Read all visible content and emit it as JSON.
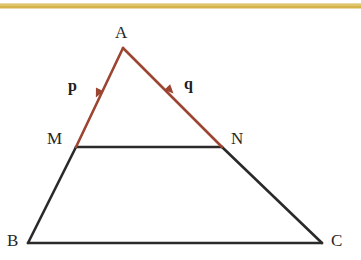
{
  "figure": {
    "type": "geometry-diagram",
    "background_color": "#ffffff",
    "width": 361,
    "height": 260,
    "top_rule": {
      "name": "gold-divider",
      "color": "#d4b44a",
      "y": 6,
      "thickness": 5
    },
    "colors": {
      "vector_stroke": "#9c4530",
      "edge_stroke": "#2a2a2a",
      "label_text": "#262626"
    },
    "points": {
      "A": {
        "label": "A",
        "x": 123,
        "y": 48
      },
      "M": {
        "label": "M",
        "x": 76,
        "y": 147
      },
      "N": {
        "label": "N",
        "x": 222,
        "y": 147
      },
      "B": {
        "label": "B",
        "x": 28,
        "y": 243
      },
      "C": {
        "label": "C",
        "x": 322,
        "y": 243
      }
    },
    "vectors": [
      {
        "label": "p",
        "from": "A",
        "to": "M",
        "color": "#9c4530",
        "arrow_at": {
          "x": 98,
          "y": 93
        }
      },
      {
        "label": "q",
        "from": "A",
        "to": "N",
        "color": "#9c4530",
        "arrow_at": {
          "x": 170,
          "y": 90
        }
      }
    ],
    "edges": [
      {
        "name": "segment-MN",
        "from": "M",
        "to": "N",
        "color": "#2a2a2a"
      },
      {
        "name": "segment-MB",
        "from": "M",
        "to": "B",
        "color": "#2a2a2a"
      },
      {
        "name": "segment-NC",
        "from": "N",
        "to": "C",
        "color": "#2a2a2a"
      },
      {
        "name": "segment-BC",
        "from": "B",
        "to": "C",
        "color": "#2a2a2a"
      }
    ]
  }
}
